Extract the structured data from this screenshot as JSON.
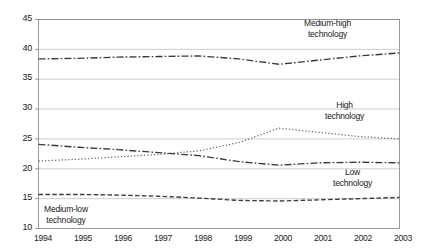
{
  "chart_data": {
    "type": "line",
    "title": "",
    "subtitle": "",
    "xlabel": "",
    "ylabel": "",
    "grid": true,
    "legend_position": "inline-annotations",
    "categories": [
      "1994",
      "1995",
      "1996",
      "1997",
      "1998",
      "1999",
      "2000",
      "2001",
      "2002",
      "2003"
    ],
    "x": [
      1994,
      1995,
      1996,
      1997,
      1998,
      1999,
      2000,
      2001,
      2002,
      2003
    ],
    "xlim": [
      1994,
      2003
    ],
    "ylim": [
      10,
      45
    ],
    "yticks": [
      10,
      15,
      20,
      25,
      30,
      35,
      40,
      45
    ],
    "series": [
      {
        "name": "Medium-high technology",
        "style": "dash-dot",
        "color": "#3a3a3a",
        "values": [
          38.4,
          38.5,
          38.7,
          38.8,
          38.9,
          38.4,
          37.5,
          38.2,
          38.9,
          39.4
        ]
      },
      {
        "name": "High technology",
        "style": "dotted",
        "color": "#6e6e6e",
        "values": [
          21.3,
          21.6,
          22.0,
          22.4,
          23.0,
          24.4,
          26.8,
          26.1,
          25.4,
          25.0
        ]
      },
      {
        "name": "Low technology",
        "style": "dash-dot",
        "color": "#3a3a3a",
        "values": [
          24.1,
          23.6,
          23.2,
          22.7,
          22.2,
          21.2,
          20.6,
          21.0,
          21.1,
          21.0
        ]
      },
      {
        "name": "Medium-low technology",
        "style": "dashed",
        "color": "#3a3a3a",
        "values": [
          15.7,
          15.7,
          15.6,
          15.4,
          15.1,
          14.7,
          14.6,
          14.8,
          15.0,
          15.2
        ]
      }
    ],
    "annotations": [
      {
        "id": "medium-high",
        "line1": "Medium-high",
        "line2": "technology"
      },
      {
        "id": "high",
        "line1": "High",
        "line2": "technology"
      },
      {
        "id": "low",
        "line1": "Low",
        "line2": "technology"
      },
      {
        "id": "medium-low",
        "line1": "Medium-low",
        "line2": "technology"
      }
    ]
  },
  "axes": {
    "y_labels": [
      "45",
      "40",
      "35",
      "30",
      "25",
      "20",
      "15",
      "10"
    ],
    "x_labels": [
      "1994",
      "1995",
      "1996",
      "1997",
      "1998",
      "1999",
      "2000",
      "2001",
      "2002",
      "2003"
    ]
  },
  "colors": {
    "grid": "#b8b8b8",
    "axis": "#808080",
    "text": "#1a1a1a",
    "series_dark": "#3a3a3a",
    "series_light": "#6e6e6e",
    "background": "#ffffff"
  }
}
